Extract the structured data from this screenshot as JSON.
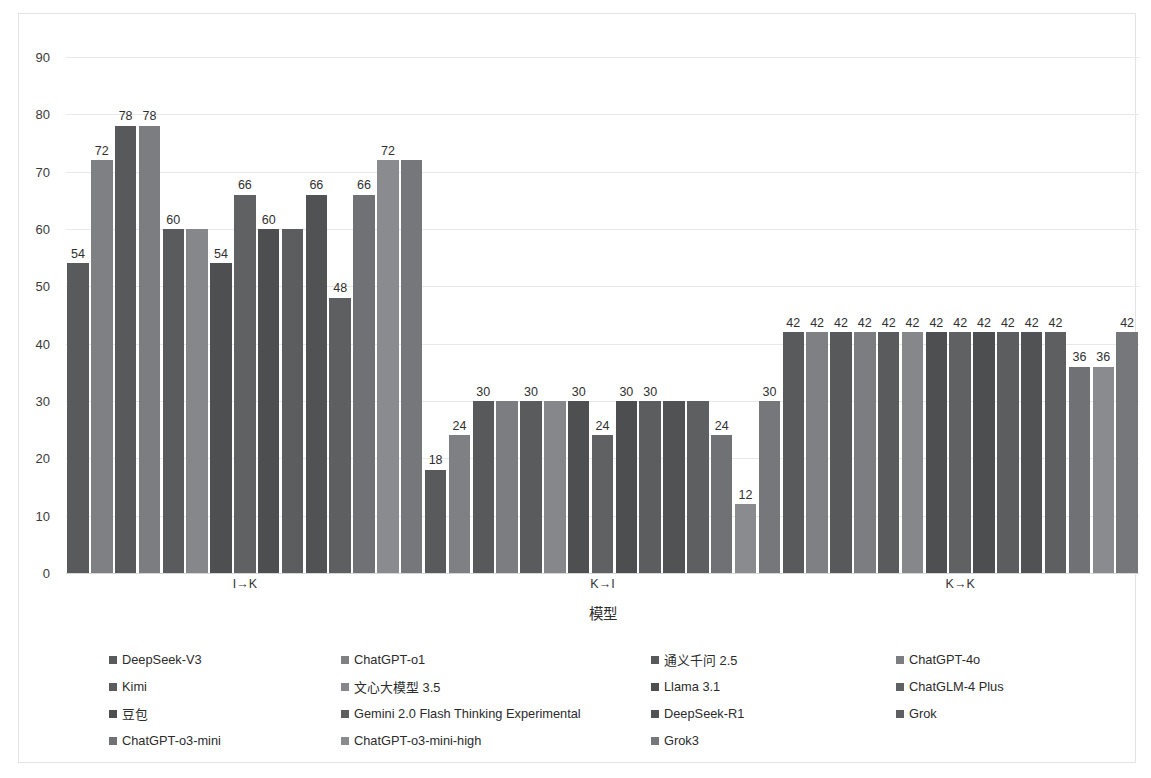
{
  "chart_data": {
    "type": "bar",
    "title": "",
    "xlabel": "模型",
    "ylabel": "",
    "ylim": [
      0,
      90
    ],
    "ytick_step": 10,
    "yticks": [
      "90",
      "80",
      "70",
      "60",
      "50",
      "40",
      "30",
      "20",
      "10",
      "0"
    ],
    "grid": true,
    "legend_position": "bottom",
    "categories": [
      "I→K",
      "K→I",
      "K→K"
    ],
    "series": [
      {
        "name": "DeepSeek-V3",
        "color": "#595a5c",
        "values": [
          54,
          18,
          42
        ]
      },
      {
        "name": "ChatGPT-o1",
        "color": "#7f8083",
        "values": [
          72,
          24,
          42
        ]
      },
      {
        "name": "通义千问 2.5",
        "color": "#58595b",
        "values": [
          78,
          30,
          42
        ]
      },
      {
        "name": "ChatGPT-4o",
        "color": "#7c7d80",
        "values": [
          78,
          30,
          42
        ]
      },
      {
        "name": "Kimi",
        "color": "#5a5b5d",
        "values": [
          60,
          30,
          42
        ]
      },
      {
        "name": "文心大模型 3.5",
        "color": "#86878a",
        "values": [
          60,
          30,
          42
        ]
      },
      {
        "name": "Llama 3.1",
        "color": "#4e4f51",
        "values": [
          54,
          30,
          42
        ]
      },
      {
        "name": "ChatGLM-4 Plus",
        "color": "#606163",
        "values": [
          66,
          24,
          42
        ]
      },
      {
        "name": "豆包",
        "color": "#4d4e50",
        "values": [
          60,
          30,
          42
        ]
      },
      {
        "name": "Gemini 2.0 Flash Thinking Experimental",
        "color": "#5c5d5f",
        "values": [
          60,
          30,
          42
        ]
      },
      {
        "name": "DeepSeek-R1",
        "color": "#515254",
        "values": [
          66,
          30,
          42
        ]
      },
      {
        "name": "Grok",
        "color": "#5e5f61",
        "values": [
          48,
          30,
          42
        ]
      },
      {
        "name": "ChatGPT-o3-mini",
        "color": "#707174",
        "values": [
          66,
          24,
          36
        ]
      },
      {
        "name": "ChatGPT-o3-mini-high",
        "color": "#8a8b8e",
        "values": [
          72,
          12,
          36
        ]
      },
      {
        "name": "Grok3",
        "color": "#76777a",
        "values": [
          72,
          30,
          42
        ]
      }
    ]
  },
  "legend": {
    "rows": [
      [
        {
          "label": "DeepSeek-V3",
          "color": "#595a5c"
        },
        {
          "label": "ChatGPT-o1",
          "color": "#7f8083"
        },
        {
          "label": "通义千问 2.5",
          "color": "#58595b"
        },
        {
          "label": "ChatGPT-4o",
          "color": "#7c7d80"
        }
      ],
      [
        {
          "label": "Kimi",
          "color": "#5a5b5d"
        },
        {
          "label": "文心大模型 3.5",
          "color": "#86878a"
        },
        {
          "label": "Llama 3.1",
          "color": "#4e4f51"
        },
        {
          "label": "ChatGLM-4 Plus",
          "color": "#606163"
        }
      ],
      [
        {
          "label": "豆包",
          "color": "#4d4e50"
        },
        {
          "label": "Gemini 2.0 Flash Thinking Experimental",
          "color": "#5c5d5f"
        },
        {
          "label": "DeepSeek-R1",
          "color": "#515254"
        },
        {
          "label": "Grok",
          "color": "#5e5f61"
        }
      ],
      [
        {
          "label": "ChatGPT-o3-mini",
          "color": "#707174"
        },
        {
          "label": "ChatGPT-o3-mini-high",
          "color": "#8a8b8e"
        },
        {
          "label": "Grok3",
          "color": "#76777a"
        }
      ]
    ]
  }
}
